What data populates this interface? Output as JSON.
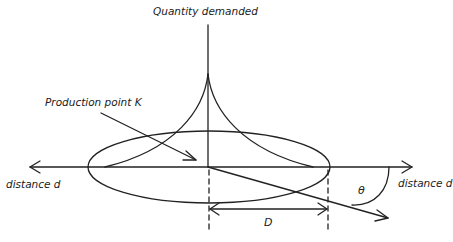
{
  "diagram": {
    "labels": {
      "y_axis": "Quantity demanded",
      "production_point": "Production point K",
      "x_axis_left": "distance d",
      "x_axis_right": "distance d",
      "distance_D": "D",
      "angle": "θ"
    },
    "colors": {
      "stroke": "#222222",
      "background": "#ffffff"
    },
    "elements": [
      "vertical axis (quantity demanded) with cusp-shaped demand curve peaking at production point",
      "horizontal bidirectional axis (distance d)",
      "ellipse market area centered at production point K",
      "arrow pointing to production point K",
      "radial ray from K at angle θ below the axis",
      "dashed vertical markers with double arrow labeled D (market radius)"
    ]
  }
}
